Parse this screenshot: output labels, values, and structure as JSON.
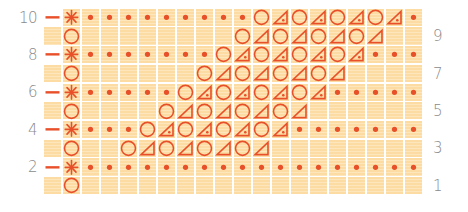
{
  "chart": {
    "title": "",
    "colors": {
      "symbol": "#e8502a",
      "cell": "#fcdca2",
      "grid_line": "#ffffff",
      "label": "#8a8a8a"
    },
    "legend_symbols": {
      "*": "star-stitch",
      ".": "dot-purl",
      "O": "yarn-over-circle",
      "A": "triangle-decrease",
      "B": "triangle-decrease-with-dot",
      "_": "blank-knit"
    },
    "left_labels": [
      "10",
      "8",
      "6",
      "4",
      "2"
    ],
    "right_labels": [
      "9",
      "7",
      "5",
      "3",
      "1"
    ],
    "rows": [
      {
        "row": 10,
        "side": "left",
        "edge": "-",
        "stitches": "*.........OBOBOBOB."
      },
      {
        "row": 9,
        "side": "right",
        "edge": "",
        "stitches": "O________OAOAOAOA__"
      },
      {
        "row": 8,
        "side": "left",
        "edge": "-",
        "stitches": "*.......OBOBOBOB..."
      },
      {
        "row": 7,
        "side": "right",
        "edge": "",
        "stitches": "O______OAOAOAOA____"
      },
      {
        "row": 6,
        "side": "left",
        "edge": "-",
        "stitches": "*.....OBOBOBOB....."
      },
      {
        "row": 5,
        "side": "right",
        "edge": "",
        "stitches": "O____OAOAOAOA______"
      },
      {
        "row": 4,
        "side": "left",
        "edge": "-",
        "stitches": "*...OBOBOBOB......."
      },
      {
        "row": 3,
        "side": "right",
        "edge": "",
        "stitches": "O__OAOAOAOA________"
      },
      {
        "row": 2,
        "side": "left",
        "edge": "-",
        "stitches": "*.................."
      },
      {
        "row": 1,
        "side": "right",
        "edge": "",
        "stitches": "O__________________"
      }
    ]
  },
  "chart_data": {
    "type": "table",
    "xlabel": "",
    "ylabel": "Row",
    "row_labels_left": [
      10,
      8,
      6,
      4,
      2
    ],
    "row_labels_right": [
      9,
      7,
      5,
      3,
      1
    ],
    "columns": 19,
    "symbol_key": {
      "*": "star",
      ".": "dot",
      "O": "circle (yarn over)",
      "A": "triangle (decrease)",
      "B": "triangle with dot",
      "_": "empty"
    },
    "rows": {
      "10": "*.........OBOBOBOB.",
      "9": "O________OAOAOAOA__",
      "8": "*.......OBOBOBOB...",
      "7": "O______OAOAOAOA____",
      "6": "*.....OBOBOBOB.....",
      "5": "O____OAOAOAOA______",
      "4": "*...OBOBOBOB.......",
      "3": "O__OAOAOAOA________",
      "2": "*..................",
      "1": "O__________________"
    },
    "edge_markers": {
      "10": "-",
      "8": "-",
      "6": "-",
      "4": "-",
      "2": "-"
    }
  }
}
